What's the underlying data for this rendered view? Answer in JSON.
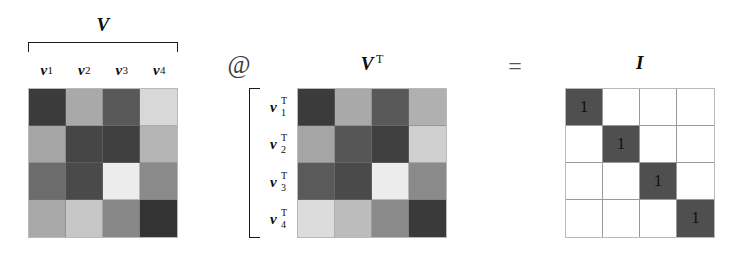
{
  "figure": {
    "equation": "V @ V^T = I",
    "matrix_size": 4
  },
  "labels": {
    "v_title": "V",
    "vt_title": "V",
    "vt_superscript": "T",
    "i_title": "I",
    "matmul_operator": "@",
    "equals_operator": "=",
    "column_labels": [
      {
        "symbol": "v",
        "sub": "1"
      },
      {
        "symbol": "v",
        "sub": "2"
      },
      {
        "symbol": "v",
        "sub": "3"
      },
      {
        "symbol": "v",
        "sub": "4"
      }
    ],
    "row_labels": [
      {
        "symbol": "v",
        "sub": "1",
        "sup": "T"
      },
      {
        "symbol": "v",
        "sub": "2",
        "sup": "T"
      },
      {
        "symbol": "v",
        "sub": "3",
        "sup": "T"
      },
      {
        "symbol": "v",
        "sub": "4",
        "sup": "T"
      }
    ]
  },
  "chart_data": {
    "type": "heatmap",
    "xlabel": "",
    "ylabel": "",
    "grid": true,
    "legend": "none",
    "colorscale": "grayscale",
    "panels": [
      {
        "name": "V",
        "title": "V",
        "col_labels": [
          "v1",
          "v2",
          "v3",
          "v4"
        ],
        "row_labels": [
          "",
          "",
          "",
          ""
        ],
        "cell_colors": [
          [
            "#3b3b3b",
            "#a9a9a9",
            "#595959",
            "#d8d8d8"
          ],
          [
            "#a5a5a5",
            "#464646",
            "#3f3f3f",
            "#b4b4b4"
          ],
          [
            "#6c6c6c",
            "#4a4a4a",
            "#ececec",
            "#8a8a8a"
          ],
          [
            "#a8a8a8",
            "#c6c6c6",
            "#888888",
            "#333333"
          ]
        ],
        "values": [
          [
            0.23,
            0.66,
            0.35,
            0.85
          ],
          [
            0.65,
            0.27,
            0.25,
            0.71
          ],
          [
            0.42,
            0.29,
            0.93,
            0.54
          ],
          [
            0.66,
            0.78,
            0.53,
            0.2
          ]
        ]
      },
      {
        "name": "V^T",
        "title": "V",
        "col_labels": [
          "",
          "",
          "",
          ""
        ],
        "row_labels": [
          "v1T",
          "v2T",
          "v3T",
          "v4T"
        ],
        "cell_colors": [
          [
            "#3b3b3b",
            "#a9a9a9",
            "#595959",
            "#b0b0b0"
          ],
          [
            "#a5a5a5",
            "#565656",
            "#3f3f3f",
            "#cfcfcf"
          ],
          [
            "#5a5a5a",
            "#4a4a4a",
            "#ececec",
            "#8a8a8a"
          ],
          [
            "#dcdcdc",
            "#bcbcbc",
            "#8a8a8a",
            "#3a3a3a"
          ]
        ],
        "values": [
          [
            0.23,
            0.66,
            0.35,
            0.69
          ],
          [
            0.65,
            0.34,
            0.25,
            0.81
          ],
          [
            0.35,
            0.29,
            0.93,
            0.54
          ],
          [
            0.86,
            0.74,
            0.54,
            0.23
          ]
        ]
      },
      {
        "name": "I",
        "title": "I",
        "col_labels": [
          "",
          "",
          "",
          ""
        ],
        "row_labels": [
          "",
          "",
          "",
          ""
        ],
        "cell_colors": [
          [
            "#4f4f4f",
            "#ffffff",
            "#ffffff",
            "#ffffff"
          ],
          [
            "#ffffff",
            "#4f4f4f",
            "#ffffff",
            "#ffffff"
          ],
          [
            "#ffffff",
            "#ffffff",
            "#4f4f4f",
            "#ffffff"
          ],
          [
            "#ffffff",
            "#ffffff",
            "#ffffff",
            "#4f4f4f"
          ]
        ],
        "cell_text": [
          [
            "1",
            "",
            "",
            ""
          ],
          [
            "",
            "1",
            "",
            ""
          ],
          [
            "",
            "",
            "1",
            ""
          ],
          [
            "",
            "",
            "",
            "1"
          ]
        ],
        "values": [
          [
            1,
            0,
            0,
            0
          ],
          [
            0,
            1,
            0,
            0
          ],
          [
            0,
            0,
            1,
            0
          ],
          [
            0,
            0,
            0,
            1
          ]
        ]
      }
    ]
  }
}
